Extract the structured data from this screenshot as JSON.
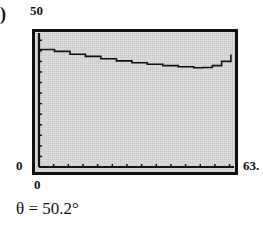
{
  "part_label": ")",
  "caption": "θ = 50.2°",
  "chart_data": {
    "type": "line",
    "title": "",
    "xlabel": "",
    "ylabel": "",
    "xlim": [
      0,
      63
    ],
    "ylim": [
      0,
      50
    ],
    "x_tick_labels": {
      "min": "0",
      "max": "63."
    },
    "y_tick_labels": {
      "min": "0",
      "max": "50"
    },
    "grid": false,
    "x_ticks_count": 13,
    "y_ticks_count": 12,
    "series": [
      {
        "name": "curve",
        "x": [
          0,
          5,
          10,
          15,
          20,
          25,
          30,
          35,
          40,
          45,
          50,
          53,
          56,
          59,
          62
        ],
        "y": [
          44.5,
          43.8,
          42.7,
          41.9,
          41.0,
          40.2,
          39.5,
          38.9,
          38.4,
          38.0,
          37.6,
          37.7,
          38.4,
          40.0,
          42.6
        ]
      }
    ],
    "annotations": [
      "θ = 50.2°"
    ]
  }
}
